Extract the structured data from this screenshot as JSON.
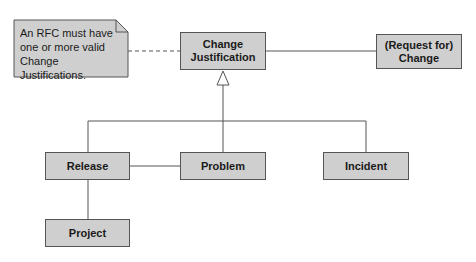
{
  "diagram": {
    "note": {
      "lines": [
        "An RFC must have",
        "one or more valid",
        "Change Justifications."
      ]
    },
    "nodes": {
      "change_justification": {
        "label": "Change\nJustification"
      },
      "request_for_change": {
        "label": "(Request for)\nChange"
      },
      "release": {
        "label": "Release"
      },
      "problem": {
        "label": "Problem"
      },
      "incident": {
        "label": "Incident"
      },
      "project": {
        "label": "Project"
      }
    },
    "edges": [
      {
        "from": "note",
        "to": "change_justification",
        "style": "dashed"
      },
      {
        "from": "change_justification",
        "to": "request_for_change",
        "style": "solid"
      },
      {
        "from": "release",
        "to": "change_justification",
        "style": "generalization"
      },
      {
        "from": "problem",
        "to": "change_justification",
        "style": "generalization"
      },
      {
        "from": "incident",
        "to": "change_justification",
        "style": "generalization"
      },
      {
        "from": "release",
        "to": "problem",
        "style": "solid"
      },
      {
        "from": "release",
        "to": "project",
        "style": "solid"
      }
    ],
    "colors": {
      "box_fill": "#cfcfcf",
      "box_border": "#555555",
      "line": "#555555"
    }
  }
}
